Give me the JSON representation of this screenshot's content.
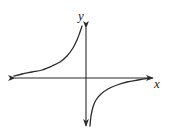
{
  "figure": {
    "kind": "math-graph",
    "background_color": "#ffffff",
    "stroke_color": "#2b2b2b",
    "axis_label_color": "#1a1a1a"
  },
  "axes": {
    "x_axis": {
      "label": "x",
      "label_position": {
        "x": 157,
        "y": 88
      },
      "line": {
        "x1": 13,
        "y1": 78,
        "x2": 155,
        "y2": 78
      },
      "arrowheads": "both"
    },
    "y_axis": {
      "label": "y",
      "label_position": {
        "x": 81,
        "y": 20
      },
      "line": {
        "x1": 86,
        "y1": 26,
        "x2": 86,
        "y2": 128
      },
      "arrowheads": "both"
    },
    "origin": {
      "x": 86,
      "y": 78
    }
  },
  "chart_data": {
    "type": "line",
    "title": "",
    "xlabel": "x",
    "ylabel": "y",
    "grid": false,
    "legend": false,
    "function": "y = -k/x",
    "xlim": [
      -73,
      69
    ],
    "ylim": [
      -50,
      52
    ],
    "series": [
      {
        "name": "branch-upper-left",
        "quadrant": "II",
        "points": [
          {
            "x": 14,
            "y": 76
          },
          {
            "x": 22,
            "y": 74
          },
          {
            "x": 32,
            "y": 72
          },
          {
            "x": 42,
            "y": 70
          },
          {
            "x": 52,
            "y": 66
          },
          {
            "x": 60,
            "y": 62
          },
          {
            "x": 67,
            "y": 56
          },
          {
            "x": 73,
            "y": 48
          },
          {
            "x": 77,
            "y": 40
          },
          {
            "x": 80,
            "y": 32
          },
          {
            "x": 82,
            "y": 26
          }
        ]
      },
      {
        "name": "branch-lower-right",
        "quadrant": "IV",
        "points": [
          {
            "x": 90,
            "y": 126
          },
          {
            "x": 91,
            "y": 116
          },
          {
            "x": 93,
            "y": 107
          },
          {
            "x": 96,
            "y": 100
          },
          {
            "x": 101,
            "y": 94
          },
          {
            "x": 108,
            "y": 89
          },
          {
            "x": 117,
            "y": 85
          },
          {
            "x": 127,
            "y": 82
          },
          {
            "x": 138,
            "y": 80
          },
          {
            "x": 150,
            "y": 78
          }
        ]
      }
    ]
  }
}
